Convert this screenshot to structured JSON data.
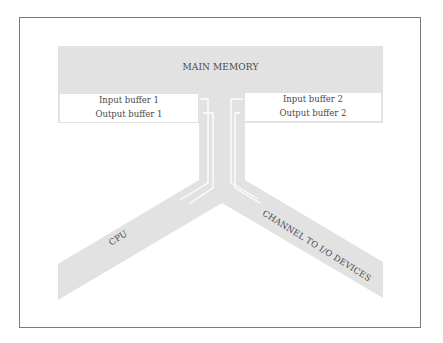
{
  "diagram": {
    "type": "block-flow",
    "colors": {
      "block_fill": "#e2e2e2",
      "buffer_fill": "#ffffff",
      "text": "#4a4a4a",
      "frame_border": "#7a7a7a",
      "flow_lines": "#ffffff"
    },
    "main_memory": {
      "label": "MAIN MEMORY"
    },
    "buffers": {
      "left": [
        {
          "label": "Input buffer 1"
        },
        {
          "label": "Output buffer 1"
        }
      ],
      "right": [
        {
          "label": "Input buffer 2"
        },
        {
          "label": "Output buffer 2"
        }
      ]
    },
    "branches": {
      "left": {
        "label": "CPU"
      },
      "right": {
        "label": "CHANNEL TO I/O DEVICES"
      }
    }
  }
}
